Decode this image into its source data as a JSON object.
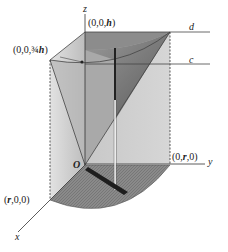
{
  "diagram": {
    "type": "3d-solid-wedge",
    "axes": {
      "x": "x",
      "y": "y",
      "z": "z"
    },
    "origin_label": "O",
    "points": {
      "top": "(0,0,h)",
      "quarter_height": "(0,0,¾h)",
      "x_end": "(r,0,0)",
      "y_end": "(0,r,0)"
    },
    "line_labels": {
      "d": "d",
      "c": "c"
    },
    "colors": {
      "light_face": "#cfcfcf",
      "mid_face": "#a8a8a8",
      "dark_face": "#6e6e6e",
      "base": "#8f8f8f",
      "lines": "#444444"
    }
  },
  "labels": {
    "z": "z",
    "y": "y",
    "x": "x",
    "O": "O",
    "top_open": "(0,0,",
    "top_h": "h",
    "top_close": ")",
    "qh_open": "(0,0,¾",
    "qh_h": "h",
    "qh_close": ")",
    "r00_open": "(",
    "r00_r": "r",
    "r00_close": ",0,0)",
    "y_open": "(0,",
    "y_r": "r",
    "y_close": ",0)",
    "d": "d",
    "c": "c"
  }
}
